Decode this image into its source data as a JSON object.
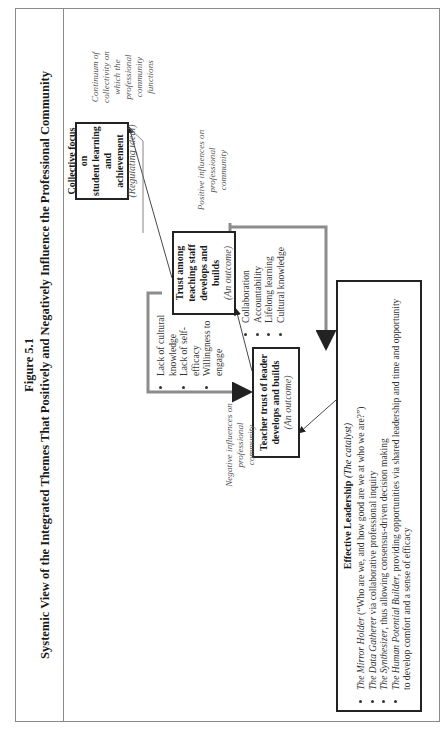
{
  "figure": {
    "number": "Figure 5.1",
    "title": "Systemic View of the Integrated Themes That Positively and Negatively Influence the Professional Community"
  },
  "nodes": {
    "collective_focus": {
      "lines": [
        "Collective focus on",
        "student learning and",
        "achievement"
      ],
      "sub": "(Regulating ideal)"
    },
    "trust_staff": {
      "lines": [
        "Trust among",
        "teaching staff",
        "develops and builds"
      ],
      "sub": "(An outcome)"
    },
    "trust_leader": {
      "lines": [
        "Teacher trust of leader",
        "develops and builds"
      ],
      "sub": "(An outcome)"
    },
    "leadership": {
      "title": "Effective Leadership",
      "title_sub": "(The catalyst)",
      "items": [
        {
          "name": "The Mirror Holder",
          "text": " (“Who are we, and how good are we at who we are?”)"
        },
        {
          "name": "The Data Gatherer",
          "text": " via collaborative professional inquiry"
        },
        {
          "name": "The Synthesizer",
          "text": ", thus allowing consensus-driven decision making"
        },
        {
          "name": "The Human Potential Builder",
          "text": ", providing opportunities via shared leadership and time and opportunity to develop comfort and a sense of efficacy"
        }
      ]
    }
  },
  "annotations": {
    "continuum": [
      "Continuum of",
      "collectivity on",
      "which the",
      "professional",
      "community",
      "functions"
    ],
    "positive": [
      "Positive influences on",
      "professional",
      "community"
    ],
    "negative": [
      "Negative influences on",
      "professional",
      "community"
    ]
  },
  "positive_influences": [
    "Collaboration",
    "Accountability",
    "Lifelong learning",
    "Cultural knowledge"
  ],
  "negative_influences": [
    "Lack of cultural knowledge",
    "Lack of self-efficacy",
    "Willingness to engage"
  ],
  "colors": {
    "bracket": "#8c8c8c",
    "box_border": "#222222",
    "frame": "#8a8a8a"
  }
}
